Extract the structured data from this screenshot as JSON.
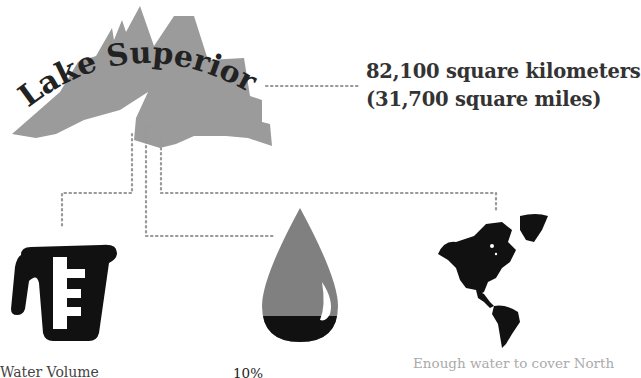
{
  "title": "Lake Superior",
  "area": {
    "line1": "82,100 square kilometers",
    "line2": "(31,700 square miles)"
  },
  "facts": [
    {
      "icon": "measuring-cup-icon",
      "label": "Water Volume"
    },
    {
      "icon": "water-drop-icon",
      "label": "10%"
    },
    {
      "icon": "americas-map-icon",
      "label": "Enough water to cover North"
    }
  ],
  "colors": {
    "lake": "#999999",
    "connector": "#999999",
    "icon_dark": "#111111",
    "drop": "#808080",
    "caption_light": "#aaaaaa"
  }
}
